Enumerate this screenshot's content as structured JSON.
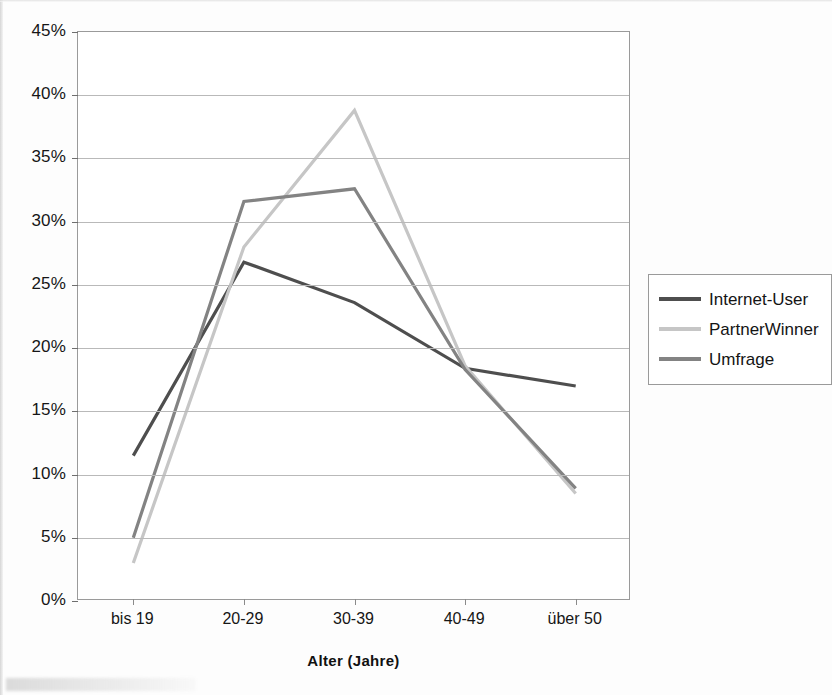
{
  "chart_data": {
    "type": "line",
    "title": "",
    "xlabel": "Alter (Jahre)",
    "ylabel": "",
    "categories": [
      "bis 19",
      "20-29",
      "30-39",
      "40-49",
      "über 50"
    ],
    "ylim": [
      0,
      45
    ],
    "ytick_step": 5,
    "ytick_labels": [
      "0%",
      "5%",
      "10%",
      "15%",
      "20%",
      "25%",
      "30%",
      "35%",
      "40%",
      "45%"
    ],
    "ytick_values": [
      0,
      5,
      10,
      15,
      20,
      25,
      30,
      35,
      40,
      45
    ],
    "grid": true,
    "grid_axis": "y",
    "legend_position": "right",
    "value_unit": "%",
    "series": [
      {
        "name": "Internet-User",
        "color": "#4e4e4e",
        "values": [
          11.5,
          26.8,
          23.6,
          18.4,
          17.0
        ]
      },
      {
        "name": "PartnerWinner",
        "color": "#c6c6c6",
        "values": [
          3.0,
          28.0,
          38.8,
          18.6,
          8.5
        ]
      },
      {
        "name": "Umfrage",
        "color": "#838383",
        "values": [
          5.0,
          31.6,
          32.6,
          18.3,
          8.9
        ]
      }
    ]
  },
  "legend": {
    "items": [
      {
        "label": "Internet-User",
        "color": "#4e4e4e",
        "swatch": "line-swatch-dark"
      },
      {
        "label": "PartnerWinner",
        "color": "#c6c6c6",
        "swatch": "line-swatch-light"
      },
      {
        "label": "Umfrage",
        "color": "#838383",
        "swatch": "line-swatch-medium"
      }
    ]
  },
  "axes": {
    "x_title": "Alter (Jahre)"
  },
  "style": {
    "axis_color": "#9a9a9a",
    "grid_color": "#b9b9b9",
    "text_color": "#161616",
    "plot_background": "#ffffff",
    "page_background": "#fdfdfd"
  }
}
